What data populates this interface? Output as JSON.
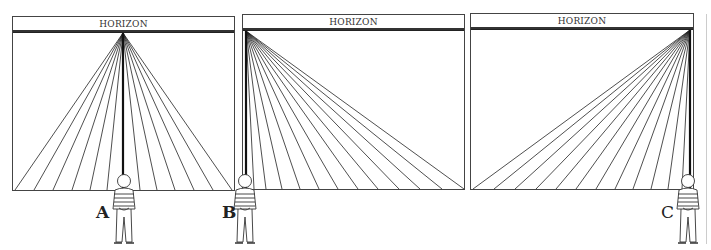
{
  "panels": [
    {
      "id": "A",
      "horizon_label": "HORIZON",
      "vanishing_point": "center",
      "viewer_label": "A"
    },
    {
      "id": "B",
      "horizon_label": "HORIZON",
      "vanishing_point": "left",
      "viewer_label": "B"
    },
    {
      "id": "C",
      "horizon_label": "HORIZON",
      "vanishing_point": "right",
      "viewer_label": "C"
    }
  ],
  "colors": {
    "line": "#222222",
    "frame": "#444444",
    "background": "#ffffff"
  }
}
